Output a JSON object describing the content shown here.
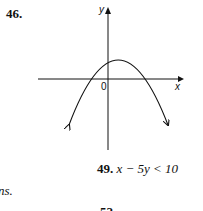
{
  "problem_46": {
    "number": "46.",
    "graph": {
      "x_axis_label": "x",
      "y_axis_label": "y",
      "origin_label": "0",
      "curve": "downward-opening parabola, vertex slightly right of y-axis, above x-axis"
    }
  },
  "fragment_left": "ns.",
  "problem_49": {
    "number": "49.",
    "expression": "x − 5y < 10"
  },
  "problem_52": {
    "number": "52."
  }
}
